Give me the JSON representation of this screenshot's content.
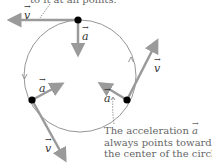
{
  "figure": {
    "top_caption_fragment": "to it at all points.",
    "bottom_caption": {
      "line1_prefix": "The acceleration ",
      "line1_symbol": "a",
      "line2": "always points toward",
      "line3": "the center of the circle."
    },
    "vector_labels": {
      "velocity": "v",
      "acceleration": "a"
    },
    "colors": {
      "arrow": "#9a9a9a",
      "circle": "#8a8a8a",
      "dot": "#000000",
      "caption_text": "#666666",
      "leader_line": "#666666"
    },
    "points": [
      {
        "name": "top",
        "velocity_direction": "left",
        "acceleration_direction": "down (toward center)"
      },
      {
        "name": "left",
        "velocity_direction": "down-right",
        "acceleration_direction": "up-right (toward center)"
      },
      {
        "name": "right",
        "velocity_direction": "up-right",
        "acceleration_direction": "up-left (toward center)"
      }
    ]
  }
}
